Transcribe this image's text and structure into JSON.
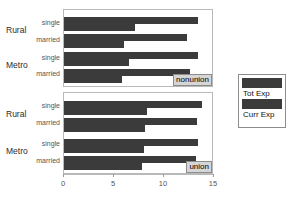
{
  "chart_data": {
    "type": "bar",
    "title": "",
    "xlabel": "",
    "ylabel": "",
    "orientation": "horizontal",
    "grid": false,
    "xlim": [
      0,
      15
    ],
    "xticks": [
      0,
      5,
      10,
      15
    ],
    "xticklabels": [
      "0",
      "5",
      "10",
      "15"
    ],
    "legend_position": "right",
    "legend_entries": [
      "Tot Exp",
      "Curr Exp"
    ],
    "panel_variable": "union status",
    "panels": [
      {
        "strip_label": "nonunion",
        "groups": [
          {
            "outer_label": "Rural",
            "rows": [
              {
                "inner_label": "single",
                "Tot Exp": 13.4,
                "Curr Exp": 7.1
              },
              {
                "inner_label": "married",
                "Tot Exp": 12.3,
                "Curr Exp": 6.0
              }
            ]
          },
          {
            "outer_label": "Metro",
            "rows": [
              {
                "inner_label": "single",
                "Tot Exp": 13.4,
                "Curr Exp": 6.5
              },
              {
                "inner_label": "married",
                "Tot Exp": 12.6,
                "Curr Exp": 5.8
              }
            ]
          }
        ]
      },
      {
        "strip_label": "union",
        "groups": [
          {
            "outer_label": "Rural",
            "rows": [
              {
                "inner_label": "single",
                "Tot Exp": 13.8,
                "Curr Exp": 8.3
              },
              {
                "inner_label": "married",
                "Tot Exp": 13.3,
                "Curr Exp": 8.1
              }
            ]
          },
          {
            "outer_label": "Metro",
            "rows": [
              {
                "inner_label": "single",
                "Tot Exp": 13.4,
                "Curr Exp": 8.0
              },
              {
                "inner_label": "married",
                "Tot Exp": 13.2,
                "Curr Exp": 7.8
              }
            ]
          }
        ]
      }
    ],
    "series": [
      {
        "name": "Tot Exp",
        "color": "#3b3b3b",
        "values": [
          13.4,
          12.3,
          13.4,
          12.6,
          13.8,
          13.3,
          13.4,
          13.2
        ]
      },
      {
        "name": "Curr Exp",
        "color": "#3b3b3b",
        "values": [
          7.1,
          6.0,
          6.5,
          5.8,
          8.3,
          8.1,
          8.0,
          7.8
        ]
      }
    ],
    "categories": [
      "nonunion / Rural / single",
      "nonunion / Rural / married",
      "nonunion / Metro / single",
      "nonunion / Metro / married",
      "union / Rural / single",
      "union / Rural / married",
      "union / Metro / single",
      "union / Metro / married"
    ]
  },
  "colors": {
    "bar": "#3b3b3b",
    "panel_border": "#b9b9b9",
    "strip_background": "#d6d6d6",
    "strip_border": "#8c8c8c",
    "axis": "#9a9a9a",
    "tick_text": "#555555",
    "inner_label": "#555555",
    "outer_label": "#2b2b2b"
  }
}
